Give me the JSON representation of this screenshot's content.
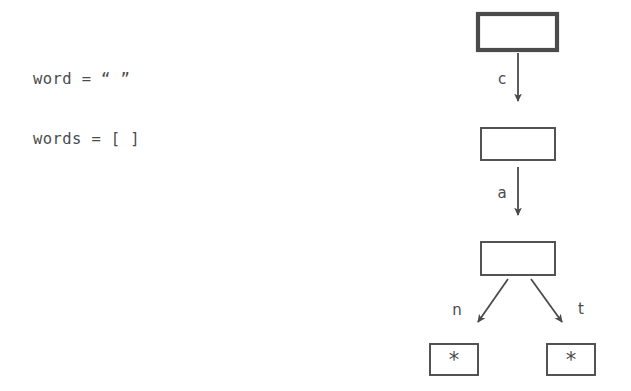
{
  "canvas": {
    "width": 631,
    "height": 391,
    "background": "#ffffff",
    "ink_color": "#4b4b4b"
  },
  "code_panel": {
    "lines": [
      "word = “ ”",
      "words = [ ]"
    ]
  },
  "diagram": {
    "type": "trie-tree",
    "nodes": [
      {
        "id": "root",
        "label": "",
        "style": "thick-border",
        "x": 478,
        "y": 14,
        "w": 79,
        "h": 36
      },
      {
        "id": "c",
        "label": "",
        "style": "thin-border",
        "x": 481,
        "y": 128,
        "w": 74,
        "h": 32
      },
      {
        "id": "ca",
        "label": "",
        "style": "thin-border",
        "x": 481,
        "y": 242,
        "w": 74,
        "h": 33
      },
      {
        "id": "can",
        "label": "*",
        "style": "thin-border",
        "x": 430,
        "y": 344,
        "w": 48,
        "h": 31
      },
      {
        "id": "cat",
        "label": "*",
        "style": "thin-border",
        "x": 547,
        "y": 344,
        "w": 48,
        "h": 31
      }
    ],
    "edges": [
      {
        "from": "root",
        "to": "c",
        "label": "c",
        "direction": "down"
      },
      {
        "from": "c",
        "to": "ca",
        "label": "a",
        "direction": "down"
      },
      {
        "from": "ca",
        "to": "can",
        "label": "n",
        "direction": "down-left"
      },
      {
        "from": "ca",
        "to": "cat",
        "label": "t",
        "direction": "down-right"
      }
    ],
    "leaf_marker": "*"
  }
}
